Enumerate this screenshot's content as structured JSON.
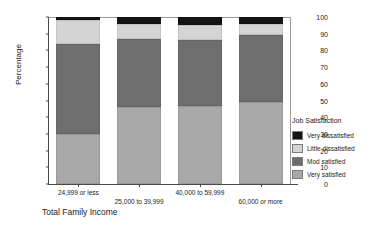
{
  "chart_data": {
    "type": "bar",
    "subtype": "stacked-bar-100",
    "title": "",
    "xlabel": "Total Family Income",
    "ylabel": "Percentage",
    "ylim": [
      0,
      100
    ],
    "yticks": [
      0,
      10,
      20,
      30,
      40,
      50,
      60,
      70,
      80,
      90,
      100
    ],
    "ytick_labels": [
      "0",
      "10",
      "20",
      "30",
      "40",
      "50",
      "60",
      "70",
      "80",
      "90",
      "100"
    ],
    "grid": false,
    "legend_position": "right",
    "legend_title": "Job Satisfaction",
    "categories": [
      "24,999 or less",
      "25,000 to 39,999",
      "40,000 to 59,999",
      "60,000 or more"
    ],
    "series": [
      {
        "name": "Very satisfied",
        "color": "#a8a8a8",
        "values": [
          30,
          46,
          47,
          49
        ]
      },
      {
        "name": "Mod satisfied",
        "color": "#6e6e6e",
        "values": [
          54,
          41,
          39,
          40
        ]
      },
      {
        "name": "Little dissatisfied",
        "color": "#d4d4d4",
        "values": [
          14,
          9,
          9,
          7
        ]
      },
      {
        "name": "Very dissatisfied",
        "color": "#141414",
        "values": [
          2,
          4,
          5,
          4
        ]
      }
    ],
    "legend_order": [
      "Very dissatisfied",
      "Little dissatisfied",
      "Mod satisfied",
      "Very satisfied"
    ]
  },
  "axes": {
    "y_title": "Percentage",
    "x_title": "Total Family Income"
  },
  "legend": {
    "title": "Job Satisfaction",
    "items": [
      {
        "label": "Very dissatisfied",
        "color": "#141414"
      },
      {
        "label": "Little dissatisfied",
        "color": "#d4d4d4"
      },
      {
        "label": "Mod satisfied",
        "color": "#6e6e6e"
      },
      {
        "label": "Very satisfied",
        "color": "#a8a8a8"
      }
    ]
  }
}
